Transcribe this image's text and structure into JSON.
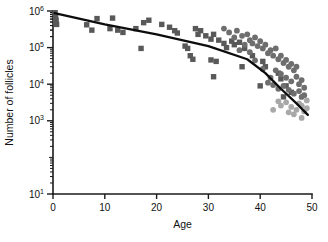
{
  "chart_data": {
    "type": "scatter",
    "title": "",
    "xlabel": "Age",
    "ylabel": "Number of follicles",
    "xlim": [
      0,
      50
    ],
    "ylim": [
      10,
      1000000
    ],
    "yscale": "log",
    "grid": false,
    "legend_position": "none",
    "xticks": [
      0,
      10,
      20,
      30,
      40,
      50
    ],
    "xticklabels": [
      "0",
      "10",
      "20",
      "30",
      "40",
      "50"
    ],
    "yticks": [
      10,
      1000,
      10000,
      100000,
      1000000
    ],
    "yticklabels": [
      "10¹",
      "10³",
      "10⁴",
      "10⁵",
      "10⁶"
    ],
    "ytick_exponents": [
      "1",
      "3",
      "4",
      "5",
      "6"
    ],
    "ytick_base": "10",
    "colors": {
      "square_marker": "#595959",
      "circle_marker": "#6e6e6e",
      "circle_light_marker": "#a8a8a8",
      "trend_line": "#0d0d0d",
      "axis": "#1a1a1a",
      "background": "#ffffff"
    },
    "series": [
      {
        "name": "squares",
        "marker": "square",
        "color": "#595959",
        "points": [
          [
            0.4,
            900000
          ],
          [
            0.5,
            700000
          ],
          [
            0.6,
            560000
          ],
          [
            0.5,
            480000
          ],
          [
            0.7,
            430000
          ],
          [
            6.5,
            420000
          ],
          [
            7.5,
            300000
          ],
          [
            8.5,
            620000
          ],
          [
            11.5,
            640000
          ],
          [
            11.0,
            330000
          ],
          [
            12.5,
            300000
          ],
          [
            13.5,
            260000
          ],
          [
            16.0,
            330000
          ],
          [
            17.5,
            480000
          ],
          [
            18.5,
            560000
          ],
          [
            17.0,
            95000
          ],
          [
            21.0,
            430000
          ],
          [
            22.5,
            360000
          ],
          [
            23.5,
            290000
          ],
          [
            24.0,
            250000
          ],
          [
            25.5,
            110000
          ],
          [
            26.0,
            95000
          ],
          [
            27.5,
            330000
          ],
          [
            28.5,
            290000
          ],
          [
            28.0,
            230000
          ],
          [
            29.5,
            210000
          ],
          [
            30.5,
            170000
          ],
          [
            26.5,
            60000
          ],
          [
            27.0,
            48000
          ],
          [
            31.0,
            230000
          ],
          [
            32.0,
            160000
          ],
          [
            33.0,
            130000
          ],
          [
            33.5,
            100000
          ],
          [
            34.5,
            150000
          ],
          [
            35.0,
            120000
          ],
          [
            30.5,
            46000
          ],
          [
            31.5,
            42000
          ],
          [
            36.0,
            140000
          ],
          [
            37.0,
            95000
          ],
          [
            38.5,
            60000
          ],
          [
            36.5,
            30000
          ],
          [
            31.0,
            16000
          ],
          [
            40.5,
            42000
          ],
          [
            41.0,
            30000
          ],
          [
            40.0,
            9000
          ],
          [
            43.5,
            20000
          ],
          [
            44.0,
            14000
          ],
          [
            45.0,
            9000
          ],
          [
            46.0,
            6000
          ],
          [
            44.5,
            4500
          ]
        ]
      },
      {
        "name": "circles-dark",
        "marker": "circle",
        "color": "#6e6e6e",
        "points": [
          [
            33.0,
            330000
          ],
          [
            34.0,
            260000
          ],
          [
            35.5,
            290000
          ],
          [
            36.5,
            210000
          ],
          [
            37.5,
            230000
          ],
          [
            38.0,
            160000
          ],
          [
            38.5,
            130000
          ],
          [
            39.0,
            190000
          ],
          [
            39.5,
            110000
          ],
          [
            40.0,
            150000
          ],
          [
            40.5,
            95000
          ],
          [
            41.0,
            120000
          ],
          [
            41.5,
            70000
          ],
          [
            42.0,
            85000
          ],
          [
            42.5,
            60000
          ],
          [
            43.0,
            95000
          ],
          [
            43.5,
            48000
          ],
          [
            44.0,
            60000
          ],
          [
            44.5,
            38000
          ],
          [
            45.0,
            46000
          ],
          [
            45.5,
            30000
          ],
          [
            46.0,
            36000
          ],
          [
            46.5,
            24000
          ],
          [
            47.0,
            30000
          ],
          [
            43.0,
            24000
          ],
          [
            44.0,
            19000
          ],
          [
            45.0,
            15000
          ],
          [
            46.0,
            12000
          ],
          [
            47.0,
            16000
          ],
          [
            47.5,
            10000
          ],
          [
            48.0,
            13000
          ],
          [
            48.5,
            8000
          ],
          [
            42.0,
            15000
          ],
          [
            41.5,
            11000
          ],
          [
            44.5,
            9000
          ],
          [
            45.5,
            7000
          ],
          [
            46.5,
            5500
          ],
          [
            47.5,
            6500
          ],
          [
            48.0,
            4500
          ],
          [
            48.5,
            5000
          ],
          [
            43.5,
            7500
          ],
          [
            42.5,
            9500
          ],
          [
            40.5,
            26000
          ],
          [
            39.0,
            45000
          ],
          [
            37.0,
            120000
          ],
          [
            35.0,
            190000
          ],
          [
            36.0,
            85000
          ],
          [
            38.0,
            75000
          ]
        ]
      },
      {
        "name": "circles-light",
        "marker": "circle-light",
        "color": "#a8a8a8",
        "points": [
          [
            45.0,
            3200
          ],
          [
            46.0,
            2400
          ],
          [
            47.0,
            2000
          ],
          [
            48.0,
            2600
          ],
          [
            48.5,
            1800
          ],
          [
            49.0,
            2200
          ],
          [
            44.0,
            2600
          ],
          [
            46.5,
            1500
          ],
          [
            47.5,
            3000
          ],
          [
            43.5,
            3400
          ],
          [
            49.0,
            3600
          ],
          [
            48.0,
            1200
          ],
          [
            45.5,
            1700
          ],
          [
            42.5,
            2000
          ]
        ]
      }
    ],
    "trend_line": {
      "name": "fitted-decline",
      "color": "#0d0d0d",
      "points": [
        [
          0.3,
          870000
        ],
        [
          10.0,
          430000
        ],
        [
          20.0,
          230000
        ],
        [
          30.0,
          110000
        ],
        [
          37.5,
          48000
        ],
        [
          41.0,
          20000
        ],
        [
          44.0,
          7500
        ],
        [
          47.0,
          3000
        ],
        [
          49.2,
          1450
        ]
      ]
    }
  }
}
